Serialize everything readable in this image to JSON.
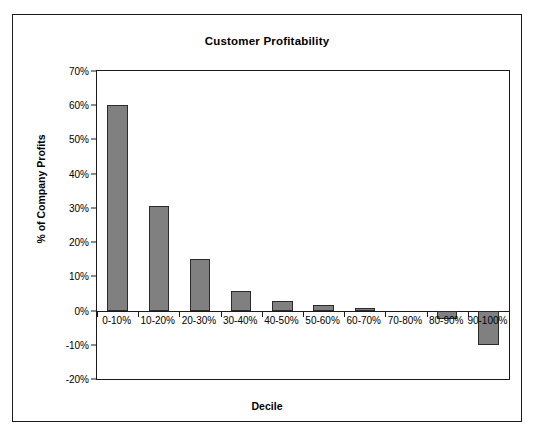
{
  "chart_data": {
    "type": "bar",
    "title": "Customer Profitability",
    "xlabel": "Decile",
    "ylabel": "% of Company Profits",
    "categories": [
      "0-10%",
      "10-20%",
      "20-30%",
      "30-40%",
      "40-50%",
      "50-60%",
      "60-70%",
      "70-80%",
      "80-90%",
      "90-100%"
    ],
    "values": [
      60,
      30.5,
      15,
      5.8,
      2.8,
      1.5,
      0.8,
      0,
      -2.5,
      -10
    ],
    "ylim": [
      -20,
      70
    ],
    "ytick_labels": [
      "70%",
      "60%",
      "50%",
      "40%",
      "30%",
      "20%",
      "10%",
      "0%",
      "-10%",
      "-20%"
    ],
    "ytick_values": [
      70,
      60,
      50,
      40,
      30,
      20,
      10,
      0,
      -10,
      -20
    ],
    "grid": false,
    "legend": "none",
    "bar_color": "#808080",
    "bar_border_color": "#2b2b2b",
    "axis_color": "#1a1a1a"
  }
}
